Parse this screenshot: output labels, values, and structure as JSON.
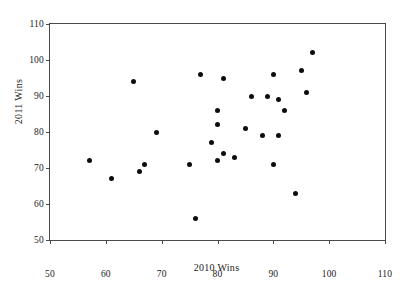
{
  "chart_data": {
    "type": "scatter",
    "title": "",
    "xlabel": "2010 Wins",
    "ylabel": "2011 Wins",
    "xlim": [
      50,
      110
    ],
    "ylim": [
      50,
      110
    ],
    "xticks": [
      50,
      60,
      70,
      80,
      90,
      100,
      110
    ],
    "yticks": [
      50,
      60,
      70,
      80,
      90,
      100,
      110
    ],
    "grid": false,
    "legend": null,
    "marker": {
      "shape": "circle",
      "color": "#0d0d0d",
      "size_px": 5
    },
    "points": [
      {
        "x": 57,
        "y": 72
      },
      {
        "x": 61,
        "y": 67
      },
      {
        "x": 65,
        "y": 94
      },
      {
        "x": 66,
        "y": 69
      },
      {
        "x": 67,
        "y": 71
      },
      {
        "x": 69,
        "y": 80
      },
      {
        "x": 75,
        "y": 71
      },
      {
        "x": 76,
        "y": 56
      },
      {
        "x": 77,
        "y": 96
      },
      {
        "x": 79,
        "y": 77
      },
      {
        "x": 80,
        "y": 86
      },
      {
        "x": 80,
        "y": 82
      },
      {
        "x": 80,
        "y": 72
      },
      {
        "x": 81,
        "y": 95
      },
      {
        "x": 81,
        "y": 74
      },
      {
        "x": 83,
        "y": 73
      },
      {
        "x": 85,
        "y": 81
      },
      {
        "x": 86,
        "y": 90
      },
      {
        "x": 88,
        "y": 79
      },
      {
        "x": 89,
        "y": 90
      },
      {
        "x": 90,
        "y": 96
      },
      {
        "x": 90,
        "y": 71
      },
      {
        "x": 91,
        "y": 89
      },
      {
        "x": 91,
        "y": 79
      },
      {
        "x": 92,
        "y": 86
      },
      {
        "x": 94,
        "y": 63
      },
      {
        "x": 95,
        "y": 97
      },
      {
        "x": 96,
        "y": 91
      },
      {
        "x": 97,
        "y": 102
      }
    ]
  },
  "axes": {
    "x_tick_labels": [
      "50",
      "60",
      "70",
      "80",
      "90",
      "100",
      "110"
    ],
    "y_tick_labels": [
      "50",
      "60",
      "70",
      "80",
      "90",
      "100",
      "110"
    ]
  }
}
